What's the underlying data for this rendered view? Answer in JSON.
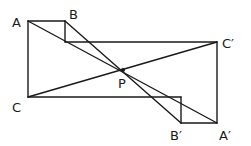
{
  "diagram": {
    "labels": {
      "A": "A",
      "B": "B",
      "C": "C",
      "C_prime": "C′",
      "P": "P",
      "B_prime": "B′",
      "A_prime": "A′"
    },
    "colors": {
      "stroke": "#1a1a1a",
      "background": "#ffffff"
    }
  }
}
